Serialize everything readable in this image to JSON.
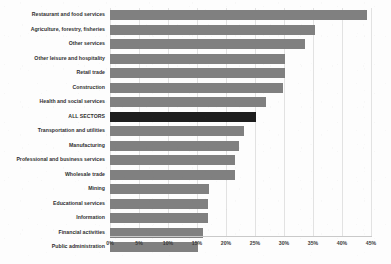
{
  "chart_data": {
    "type": "bar",
    "orientation": "horizontal",
    "title": "",
    "xlabel": "",
    "ylabel": "",
    "xlim": [
      0,
      45
    ],
    "xtick_labels": [
      "0%",
      "5%",
      "10%",
      "15%",
      "20%",
      "25%",
      "30%",
      "35%",
      "40%",
      "45%"
    ],
    "xticks": [
      0,
      5,
      10,
      15,
      20,
      25,
      30,
      35,
      40,
      45
    ],
    "grid": true,
    "legend": "none",
    "bar_color": "#808080",
    "highlight_color": "#1d1d1d",
    "highlight_category": "ALL SECTORS",
    "categories": [
      "Restaurant and food services",
      "Agriculture, forestry, fisheries",
      "Other services",
      "Other leisure and hospitality",
      "Retail trade",
      "Construction",
      "Health and social services",
      "ALL SECTORS",
      "Transportation and utilities",
      "Manufacturing",
      "Professional and business services",
      "Wholesale trade",
      "Mining",
      "Educational services",
      "Information",
      "Financial activities",
      "Public administration"
    ],
    "values": [
      44.3,
      35.3,
      33.6,
      30.2,
      30.1,
      29.9,
      26.9,
      25.2,
      23.1,
      22.2,
      21.5,
      21.5,
      17.1,
      16.9,
      16.9,
      16.0,
      15.2
    ]
  }
}
